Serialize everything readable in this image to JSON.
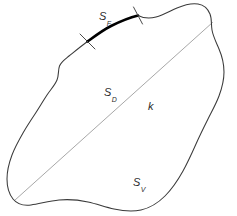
{
  "figure": {
    "background_color": "#ffffff",
    "width": 237,
    "height": 216
  },
  "colors": {
    "outline": "#3a3a3a",
    "bold_arc": "#000000",
    "chord_line": "#a8a8a8",
    "tick_mark": "#4a4a4a",
    "label_text": "#2b2b2b"
  },
  "labels": {
    "boundary_arc": {
      "base": "S",
      "subscript": "F",
      "text": "SF"
    },
    "interior_upper": {
      "base": "S",
      "subscript": "D",
      "text": "SD"
    },
    "chord": {
      "text": "k"
    },
    "interior_lower": {
      "base": "S",
      "subscript": "V",
      "text": "SV"
    }
  },
  "geometry": {
    "outline_path": "M 87.5,41.5 C 80,47 74,52 69,56 C 64,60 61,62 59.5,66 C 58,70 59,75 57,80 C 55,85 51,89 47,95 C 43,101 39,108 35,114 C 31,120 27,126 23,133 C 19,140 15,147 12,155 C 9,163 7,171 7,179 C 7,187 9,194 13,199 C 17,204 23,206 31,205 C 39,204 49,201 59,200 C 69,199 79,200 88,202 C 97,204 105,207 114,209 C 123,211 132,212 141,210 C 150,208 158,203 165,196 C 172,189 178,180 183,171 C 188,162 192,153 196,144 C 200,135 204,127 208,119 C 212,111 216,104 219,96 C 222,88 224,80 224,72 C 224,64 222,56 219,49 C 216,42 213,36 212,30 C 211,24 212,19 210,14 C 208,9 204,5 198,4 C 192,3 184,5 177,8 C 170,11 163,15 156,17 C 149,19 143,18 138,15.5",
    "bold_arc_path": "M 87.5,41.5 C 95,36 103,30 111,26 C 119,22 128,18 138,15.5",
    "chord_line": {
      "x1": 14.5,
      "y1": 200.5,
      "x2": 212.5,
      "y2": 22.5
    },
    "tick_left": {
      "x1": 80,
      "y1": 34,
      "x2": 95,
      "y2": 49
    },
    "tick_right": {
      "x1": 133,
      "y1": 7,
      "x2": 143,
      "y2": 24
    }
  }
}
